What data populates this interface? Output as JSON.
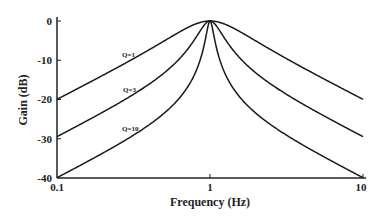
{
  "chart_data": {
    "type": "line",
    "title": "",
    "xlabel": "Frequency (Hz)",
    "ylabel": "Gain (dB)",
    "xscale": "log",
    "xlim": [
      0.1,
      10
    ],
    "ylim": [
      -40,
      0
    ],
    "xticks": [
      "0.1",
      "1",
      "10"
    ],
    "yticks": [
      "0",
      "-10",
      "-20",
      "-30",
      "-40"
    ],
    "grid": false,
    "legend": "inline labels",
    "x": [
      0.1,
      0.2,
      0.3,
      0.5,
      0.7,
      0.9,
      1.0,
      1.1,
      1.5,
      2,
      3,
      5,
      10
    ],
    "series": [
      {
        "name": "Q=1",
        "Q": 1,
        "values": [
          -19.9,
          -13.9,
          -10.6,
          -6.0,
          -3.0,
          -0.4,
          0,
          -0.4,
          -3.0,
          -4.3,
          -8.9,
          -14.0,
          -20.0
        ]
      },
      {
        "name": "Q=3",
        "Q": 3,
        "values": [
          -29.5,
          -23.3,
          -19.7,
          -13.7,
          -9.0,
          -3.5,
          0,
          -3.5,
          -9.0,
          -13.3,
          -18.1,
          -23.6,
          -29.5
        ]
      },
      {
        "name": "Q=10",
        "Q": 10,
        "values": [
          -39.9,
          -33.6,
          -30.0,
          -23.6,
          -18.4,
          -12.1,
          0,
          -12.4,
          -18.4,
          -23.5,
          -28.5,
          -33.6,
          -39.9
        ]
      }
    ]
  },
  "axes": {
    "xlabel": "Frequency (Hz)",
    "ylabel": "Gain (dB)",
    "xticks": [
      "0.1",
      "1",
      "10"
    ],
    "yticks": [
      "0",
      "-10",
      "-20",
      "-30",
      "-40"
    ]
  },
  "labels": {
    "q1": "Q=1",
    "q3": "Q=3",
    "q10": "Q=10"
  },
  "colors": {
    "line": "#1a1a1a",
    "axis": "#222222",
    "background": "#ffffff"
  }
}
